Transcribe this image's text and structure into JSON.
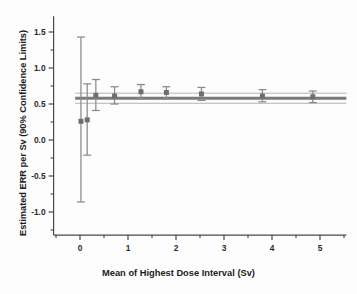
{
  "chart_data": {
    "type": "scatter",
    "title": "",
    "xlabel": "Mean of Highest Dose Interval (Sv)",
    "ylabel": "Estimated ERR per Sv (90% Confidence Limits)",
    "xlim": [
      -0.55,
      5.55
    ],
    "ylim": [
      -1.32,
      1.72
    ],
    "grid": false,
    "legend": null,
    "xticks": [
      0,
      1,
      2,
      3,
      4,
      5
    ],
    "xticklabels": [
      "0",
      "1",
      "2",
      "3",
      "4",
      "5"
    ],
    "xminorticks": [
      -0.5,
      0.5,
      1.5,
      2.5,
      3.5,
      4.5,
      5.5
    ],
    "yticks": [
      1.5,
      1.0,
      0.5,
      0.0,
      -0.5,
      -1.0
    ],
    "yticklabels": [
      "1.5",
      "1.0",
      "0.5",
      "0.0",
      "-0.5",
      "-1.0"
    ],
    "yminorticks": [
      1.75,
      1.25,
      0.75,
      0.25,
      -0.25,
      -0.75,
      -1.25
    ],
    "series": [
      {
        "name": "Estimated ERR per Sv",
        "marker": "square",
        "marker_color": "#6e6e6e",
        "error_color": "#8a8a8a",
        "x": [
          0.02,
          0.15,
          0.33,
          0.72,
          1.27,
          1.8,
          2.53,
          3.8,
          4.85
        ],
        "y": [
          0.26,
          0.28,
          0.62,
          0.61,
          0.67,
          0.66,
          0.64,
          0.61,
          0.6
        ],
        "ci_lower": [
          -0.86,
          -0.21,
          0.41,
          0.5,
          0.57,
          0.57,
          0.55,
          0.53,
          0.52
        ],
        "ci_upper": [
          1.43,
          0.78,
          0.84,
          0.74,
          0.77,
          0.74,
          0.73,
          0.7,
          0.68
        ]
      }
    ],
    "reference_band": {
      "name": "Overall estimate with 90% confidence limits",
      "center": 0.58,
      "lower": 0.51,
      "upper": 0.65,
      "center_color": "#7a7a7a",
      "bound_color": "#b4b4b4",
      "x_start": -0.1,
      "x_end": 5.55
    }
  },
  "axes": {
    "x_axis_name": "Mean of Highest Dose Interval (Sv)",
    "y_axis_name": "Estimated ERR per Sv (90% Confidence Limits)"
  }
}
